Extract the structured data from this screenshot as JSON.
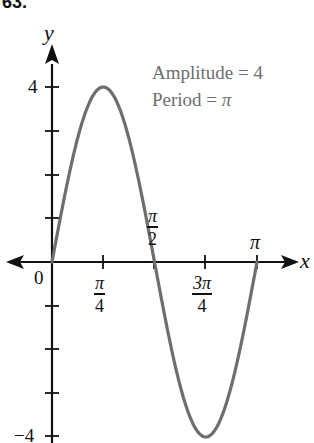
{
  "problem_number": "63.",
  "chart_data": {
    "type": "line",
    "title": "",
    "function": "y = 4 sin(2x)",
    "xlabel": "x",
    "ylabel": "y",
    "x_ticks": [
      "0",
      "π/4",
      "π/2",
      "3π/4",
      "π"
    ],
    "x_tick_values": [
      0,
      0.7854,
      1.5708,
      2.3562,
      3.1416
    ],
    "y_ticks": [
      "-4",
      "-3",
      "-2",
      "-1",
      "0",
      "1",
      "2",
      "3",
      "4"
    ],
    "y_tick_labels_shown": [
      "4",
      "-4"
    ],
    "xlim": [
      0,
      3.1416
    ],
    "ylim": [
      -4,
      4
    ],
    "grid": false,
    "series": [
      {
        "name": "y = 4 sin 2x",
        "color": "#6e6e6e",
        "x": [
          0,
          0.3927,
          0.7854,
          1.1781,
          1.5708,
          1.9635,
          2.3562,
          2.7489,
          3.1416
        ],
        "y": [
          0,
          2.83,
          4,
          2.83,
          0,
          -2.83,
          -4,
          -2.83,
          0
        ]
      }
    ],
    "annotations": [
      "Amplitude = 4",
      "Period = π"
    ]
  },
  "labels": {
    "y_axis": "y",
    "x_axis": "x",
    "origin": "0",
    "y_max": "4",
    "y_min": "−4",
    "pi_over_4": {
      "num": "π",
      "den": "4"
    },
    "pi_over_2": {
      "num": "π",
      "den": "2"
    },
    "three_pi_over_4": {
      "num": "3π",
      "den": "4"
    },
    "pi": "π",
    "amplitude_text": "Amplitude = 4",
    "period_text_prefix": "Period = ",
    "period_value": "π"
  },
  "colors": {
    "axis": "#111111",
    "curve": "#6e6e6e",
    "annotation": "#6e6e6e"
  }
}
